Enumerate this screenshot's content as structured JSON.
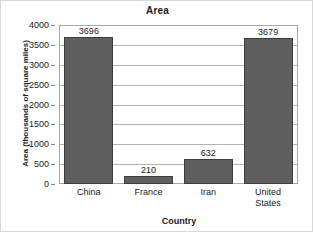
{
  "chart_data": {
    "type": "bar",
    "title": "Area",
    "xlabel": "Country",
    "ylabel": "Area (thousands of square miles)",
    "categories": [
      "China",
      "France",
      "Iran",
      "United States"
    ],
    "category_lines": [
      [
        "China"
      ],
      [
        "France"
      ],
      [
        "Iran"
      ],
      [
        "United",
        "States"
      ]
    ],
    "values": [
      3696,
      210,
      632,
      3679
    ],
    "value_labels": [
      "3696",
      "210",
      "632",
      "3679"
    ],
    "ylim": [
      0,
      4000
    ],
    "yticks": [
      0,
      500,
      1000,
      1500,
      2000,
      2500,
      3000,
      3500,
      4000
    ],
    "ytick_labels": [
      "0",
      "500",
      "1000",
      "1500",
      "2000",
      "2500",
      "3000",
      "3500",
      "4000"
    ],
    "grid": "horizontal",
    "legend": "none",
    "bar_color": "#5f5f5f",
    "bar_edge_color": "#3d3d3d",
    "gridline_color": "#b3b3b3",
    "axis_color": "#a8a8a8",
    "background_color": "#ffffff",
    "text_color": "#1a1a1a"
  }
}
